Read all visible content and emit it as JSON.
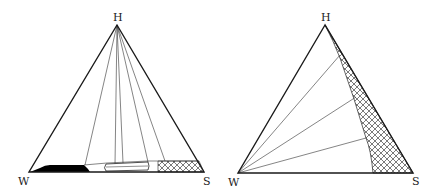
{
  "diagrams": [
    {
      "id": "left",
      "vertices": {
        "top": "H",
        "left": "W",
        "right": "S"
      },
      "regions": [
        "black-solid-region",
        "open-lens-region",
        "cross-hatched-region"
      ],
      "tie_lines_to": "H",
      "tie_line_count": 5
    },
    {
      "id": "right",
      "vertices": {
        "top": "H",
        "left": "W",
        "right": "S"
      },
      "regions": [
        "cross-hatched-region"
      ],
      "tie_lines_to": "W",
      "tie_line_count": 3
    }
  ],
  "colors": {
    "stroke": "#1a1a1a",
    "fill_solid": "#000000",
    "background": "#ffffff"
  }
}
